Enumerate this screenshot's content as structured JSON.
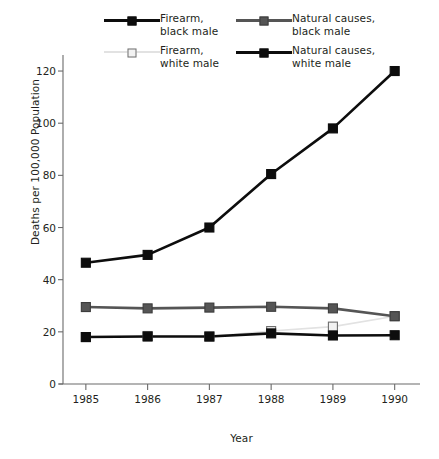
{
  "chart_data": {
    "type": "line",
    "title": "",
    "xlabel": "Year",
    "ylabel": "Deaths per 100,000 Population",
    "categories": [
      "1985",
      "1986",
      "1987",
      "1988",
      "1989",
      "1990"
    ],
    "x": [
      1985,
      1986,
      1987,
      1988,
      1989,
      1990
    ],
    "xlim": [
      1984.63,
      1990.41
    ],
    "ylim": [
      0,
      125
    ],
    "yticks": [
      0,
      20,
      40,
      60,
      80,
      100,
      120
    ],
    "ytick_labels": [
      "0",
      "20",
      "40",
      "60",
      "80",
      "100",
      "120"
    ],
    "grid": false,
    "legend_position": "top",
    "series": [
      {
        "name": "Firearm,\nblack male",
        "label_line1": "Firearm,",
        "label_line2": "black male",
        "values": [
          46.5,
          49.5,
          60,
          80.5,
          98,
          120
        ],
        "line_color": "#0d0d0d",
        "marker_fill": "#0d0d0d",
        "marker_edge": "#0d0d0d",
        "line_width": 2.6,
        "marker_size": 9
      },
      {
        "name": "Natural causes,\nblack male",
        "label_line1": "Natural causes,",
        "label_line2": "black male",
        "values": [
          29.5,
          29,
          29.3,
          29.6,
          29,
          26
        ],
        "line_color": "#555555",
        "marker_fill": "#555555",
        "marker_edge": "#3c3c3c",
        "line_width": 2.6,
        "marker_size": 9
      },
      {
        "name": "Firearm,\nwhite male",
        "label_line1": "Firearm,",
        "label_line2": "white male",
        "values": [
          18,
          18.4,
          18.2,
          20.3,
          22,
          26
        ],
        "line_color": "#e2e2e2",
        "marker_fill": "#f2f2f2",
        "marker_edge": "#6e6e6e",
        "line_width": 1.6,
        "marker_size": 9
      },
      {
        "name": "Natural causes,\nwhite male",
        "label_line1": "Natural causes,",
        "label_line2": "white male",
        "values": [
          18,
          18.2,
          18.2,
          19.4,
          18.6,
          18.7
        ],
        "line_color": "#0d0d0d",
        "marker_fill": "#0d0d0d",
        "marker_edge": "#0d0d0d",
        "line_width": 2.6,
        "marker_size": 9
      }
    ],
    "series_order_draw": [
      2,
      1,
      3,
      0
    ],
    "axis_color": "#6b6b6b"
  },
  "legend": {
    "entries": [
      {
        "series_index": 0,
        "col": 1,
        "row": 1
      },
      {
        "series_index": 1,
        "col": 2,
        "row": 1
      },
      {
        "series_index": 2,
        "col": 1,
        "row": 2
      },
      {
        "series_index": 3,
        "col": 2,
        "row": 2
      }
    ]
  }
}
